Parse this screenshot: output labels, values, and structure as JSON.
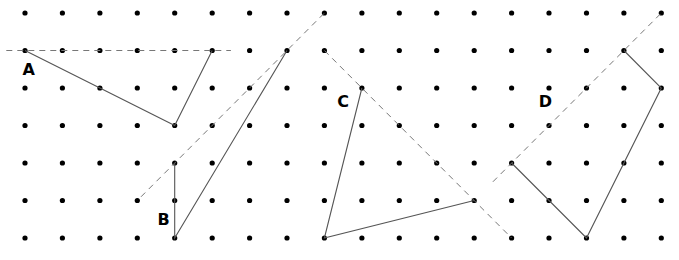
{
  "diagram": {
    "grid": {
      "columns": 18,
      "rows": 7,
      "dot_color": "#000000"
    },
    "figures": [
      {
        "id": "A",
        "label": "A",
        "solid_path": [
          [
            0,
            1
          ],
          [
            2,
            2
          ],
          [
            4,
            3
          ],
          [
            5,
            1
          ]
        ],
        "dashed_line": [
          [
            -0.5,
            1
          ],
          [
            5.5,
            1
          ]
        ],
        "label_at": [
          0.1,
          1.5
        ]
      },
      {
        "id": "B",
        "label": "B",
        "solid_path": [
          [
            4,
            4
          ],
          [
            4,
            6
          ],
          [
            7,
            1
          ]
        ],
        "dashed_line": [
          [
            3.1,
            4.9
          ],
          [
            8,
            0
          ]
        ],
        "label_at": [
          3.7,
          5.5
        ]
      },
      {
        "id": "C",
        "label": "C",
        "solid_path": [
          [
            9,
            2
          ],
          [
            8,
            6
          ],
          [
            12,
            5
          ]
        ],
        "dashed_line": [
          [
            8,
            1
          ],
          [
            13,
            6
          ]
        ],
        "label_at": [
          8.5,
          2.35
        ]
      },
      {
        "id": "D",
        "label": "D",
        "solid_path": [
          [
            16,
            1
          ],
          [
            17,
            2
          ],
          [
            15,
            6
          ],
          [
            13,
            4
          ]
        ],
        "dashed_line": [
          [
            12.5,
            4.5
          ],
          [
            17,
            0
          ]
        ],
        "label_at": [
          13.9,
          2.35
        ]
      }
    ],
    "colors": {
      "solid_line": "#555555",
      "dashed_line": "#777777",
      "label": "#000000"
    }
  }
}
